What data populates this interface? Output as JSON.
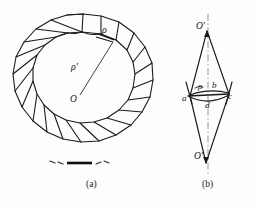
{
  "figure": {
    "background_color": "#fdfdfd",
    "line_color": "#1a1a1a",
    "accent_color": "#000000",
    "panels": [
      {
        "id": "a",
        "caption": "(a)",
        "description": "Ring of polygonal grains with centre O, boundary radius rho and ring radius rho-prime",
        "labels": [
          {
            "name": "rho",
            "text": "ρ"
          },
          {
            "name": "rho-prime",
            "text": "ρ'"
          },
          {
            "name": "centre-O",
            "text": "O"
          }
        ]
      },
      {
        "id": "b",
        "caption": "(b)",
        "description": "Lens shaped construction with apexes O-prime, chord a-c, arc b and sagitta d",
        "labels": [
          {
            "name": "O-prime-top",
            "text": "O'"
          },
          {
            "name": "O-prime-bottom",
            "text": "O'"
          },
          {
            "name": "rho",
            "text": "ρ"
          },
          {
            "name": "b",
            "text": "b"
          },
          {
            "name": "a",
            "text": "a"
          },
          {
            "name": "c",
            "text": "c"
          },
          {
            "name": "d",
            "text": "d"
          }
        ]
      }
    ],
    "captions": {
      "panel_a": "(a)",
      "panel_b": "(b)"
    },
    "symbols": {
      "rho": "ρ",
      "rho_prime": "ρ'",
      "O": "O",
      "O_prime": "O'",
      "point_a": "a",
      "point_b": "b",
      "point_c": "c",
      "point_d": "d"
    }
  }
}
